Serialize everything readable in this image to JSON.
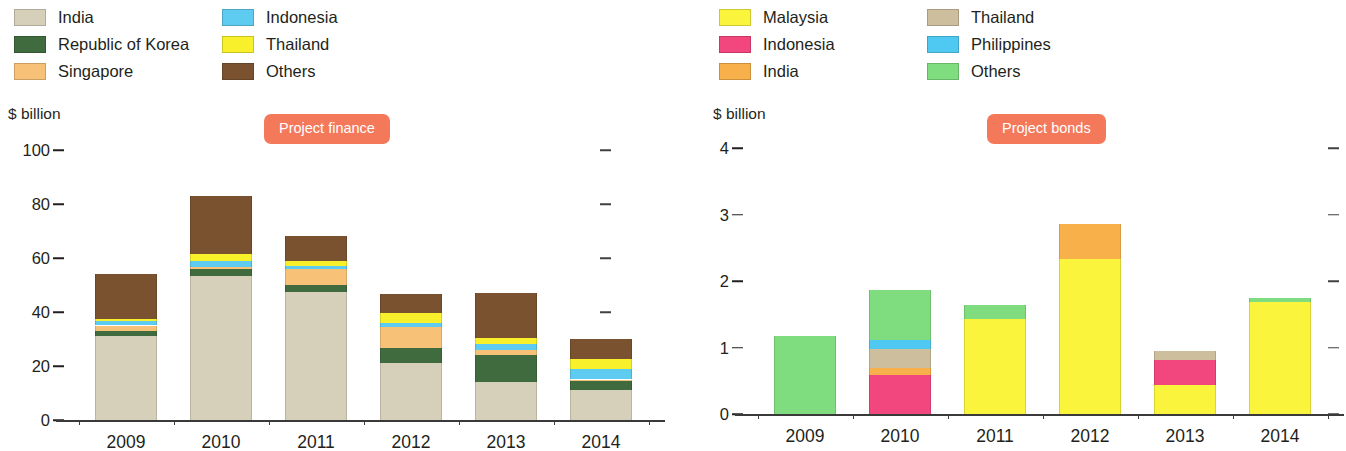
{
  "colors": {
    "accent_badge": "#f4795b",
    "text": "#231f20",
    "india_beige": "#d6d0bb",
    "korea_green": "#3f6b3f",
    "singapore_orange": "#f7c277",
    "indonesia_cyan": "#5ecbf0",
    "thailand_yellow": "#f7f02a",
    "others_brown": "#7a5230",
    "malaysia_yellow": "#faf43c",
    "indonesia_pink": "#f2467e",
    "india_orange": "#f9b council",
    "india_orange_hex": "#f8b04a",
    "thailand_tan": "#cdbf9e",
    "philippines_cyan": "#4fc8f2",
    "others_green": "#7fdd7f"
  },
  "left_panel": {
    "badge_label": "Project finance",
    "axis_unit": "$ billion",
    "legend": {
      "col1": [
        {
          "label": "India",
          "color": "#d6d0bb"
        },
        {
          "label": "Republic of Korea",
          "color": "#3f6b3f"
        },
        {
          "label": "Singapore",
          "color": "#f7c277"
        }
      ],
      "col2": [
        {
          "label": "Indonesia",
          "color": "#5ecbf0"
        },
        {
          "label": "Thailand",
          "color": "#f7f02a"
        },
        {
          "label": "Others",
          "color": "#7a5230"
        }
      ]
    }
  },
  "right_panel": {
    "badge_label": "Project bonds",
    "axis_unit": "$ billion",
    "legend": {
      "col1": [
        {
          "label": "Malaysia",
          "color": "#faf43c"
        },
        {
          "label": "Indonesia",
          "color": "#f2467e"
        },
        {
          "label": "India",
          "color": "#f8b04a"
        }
      ],
      "col2": [
        {
          "label": "Thailand",
          "color": "#cdbf9e"
        },
        {
          "label": "Philippines",
          "color": "#4fc8f2"
        },
        {
          "label": "Others",
          "color": "#7fdd7f"
        }
      ]
    }
  },
  "chart_data": [
    {
      "type": "bar",
      "id": "project-finance",
      "title": "Project finance",
      "stacked": true,
      "ylabel": "$ billion",
      "xlabel": "",
      "ylim": [
        0,
        100
      ],
      "yticks": [
        0,
        20,
        40,
        60,
        80,
        100
      ],
      "ytick_labels": [
        "0",
        "20",
        "40",
        "60",
        "80",
        "100"
      ],
      "grid": false,
      "legend_position": "top",
      "categories": [
        "2009",
        "2010",
        "2011",
        "2012",
        "2013",
        "2014"
      ],
      "series": [
        {
          "name": "India",
          "color": "#d6d0bb",
          "values": [
            31.0,
            53.5,
            47.5,
            21.0,
            14.0,
            11.0
          ]
        },
        {
          "name": "Republic of Korea",
          "color": "#3f6b3f",
          "values": [
            2.0,
            2.5,
            2.5,
            5.5,
            10.0,
            3.5
          ]
        },
        {
          "name": "Singapore",
          "color": "#f7c277",
          "values": [
            2.0,
            0.5,
            6.0,
            8.0,
            2.0,
            0.5
          ]
        },
        {
          "name": "Indonesia",
          "color": "#5ecbf0",
          "values": [
            1.5,
            2.5,
            1.0,
            1.5,
            2.0,
            4.0
          ]
        },
        {
          "name": "Thailand",
          "color": "#f7f02a",
          "values": [
            1.0,
            2.5,
            2.0,
            3.5,
            2.5,
            3.5
          ]
        },
        {
          "name": "Others",
          "color": "#7a5230",
          "values": [
            16.5,
            21.5,
            9.0,
            7.0,
            16.5,
            7.5
          ]
        }
      ],
      "totals": [
        54,
        83,
        68,
        46.5,
        47,
        30
      ]
    },
    {
      "type": "bar",
      "id": "project-bonds",
      "title": "Project bonds",
      "stacked": true,
      "ylabel": "$ billion",
      "xlabel": "",
      "ylim": [
        0,
        4
      ],
      "yticks": [
        0,
        1,
        2,
        3,
        4
      ],
      "ytick_labels": [
        "0",
        "1",
        "2",
        "3",
        "4"
      ],
      "grid": false,
      "legend_position": "top",
      "categories": [
        "2009",
        "2010",
        "2011",
        "2012",
        "2013",
        "2014"
      ],
      "series": [
        {
          "name": "Malaysia",
          "color": "#faf43c",
          "values": [
            0,
            0,
            1.43,
            2.33,
            0.44,
            1.68
          ]
        },
        {
          "name": "Indonesia",
          "color": "#f2467e",
          "values": [
            0,
            0.59,
            0,
            0,
            0.37,
            0
          ]
        },
        {
          "name": "India",
          "color": "#f8b04a",
          "values": [
            0,
            0.1,
            0,
            0.53,
            0,
            0
          ]
        },
        {
          "name": "Thailand",
          "color": "#cdbf9e",
          "values": [
            0,
            0.29,
            0,
            0,
            0.14,
            0
          ]
        },
        {
          "name": "Philippines",
          "color": "#4fc8f2",
          "values": [
            0,
            0.13,
            0,
            0,
            0,
            0
          ]
        },
        {
          "name": "Others",
          "color": "#7fdd7f",
          "values": [
            1.17,
            0.75,
            0.21,
            0,
            0,
            0.06
          ]
        }
      ],
      "totals": [
        1.17,
        1.86,
        1.64,
        2.86,
        0.95,
        1.74
      ]
    }
  ]
}
